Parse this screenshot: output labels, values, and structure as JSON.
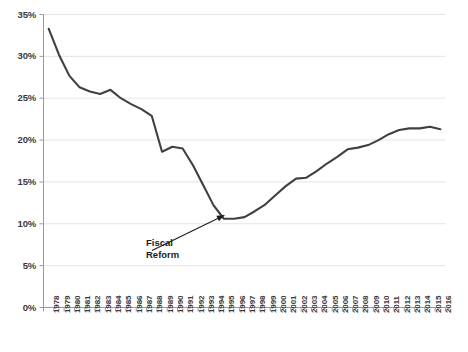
{
  "chart_data": {
    "type": "line",
    "title": "",
    "xlabel": "",
    "ylabel": "",
    "ylim": [
      0,
      35
    ],
    "ytick_step": 5,
    "grid": true,
    "legend": false,
    "legend_position": "none",
    "line_color": "#404040",
    "gridline_color": "#e4e4e4",
    "axis_color": "#9a9a9a",
    "ytick_labels": [
      "0%",
      "5%",
      "10%",
      "15%",
      "20%",
      "25%",
      "30%",
      "35%"
    ],
    "ytick_values": [
      0,
      5,
      10,
      15,
      20,
      25,
      30,
      35
    ],
    "categories": [
      "1978",
      "1979",
      "1980",
      "1981",
      "1982",
      "1983",
      "1984",
      "1985",
      "1986",
      "1987",
      "1988",
      "1989",
      "1990",
      "1991",
      "1992",
      "1993",
      "1994",
      "1995",
      "1996",
      "1997",
      "1998",
      "1999",
      "2000",
      "2001",
      "2002",
      "2003",
      "2004",
      "2005",
      "2006",
      "2007",
      "2008",
      "2009",
      "2010",
      "2011",
      "2012",
      "2013",
      "2014",
      "2015",
      "2016"
    ],
    "values": [
      33.3,
      30.2,
      27.7,
      26.3,
      25.8,
      25.5,
      26.0,
      25.0,
      24.3,
      23.7,
      22.9,
      18.6,
      19.2,
      19.0,
      17.0,
      14.6,
      12.2,
      10.6,
      10.6,
      10.8,
      11.5,
      12.3,
      13.4,
      14.5,
      15.4,
      15.5,
      16.3,
      17.2,
      18.0,
      18.9,
      19.1,
      19.4,
      20.0,
      20.7,
      21.2,
      21.4,
      21.4,
      21.6,
      21.3
    ],
    "annotations": [
      {
        "text_line1": "Fiscal",
        "text_line2": "Reform",
        "points_to_category": "1995",
        "points_to_value": 10.6
      }
    ]
  }
}
